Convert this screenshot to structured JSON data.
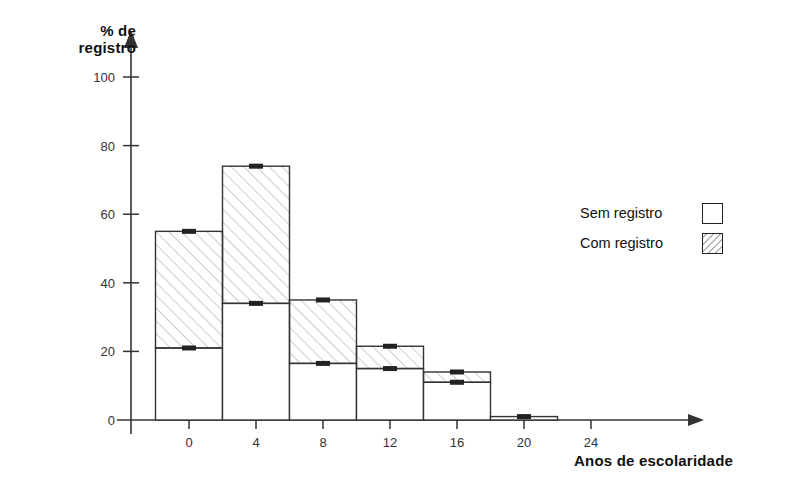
{
  "chart_data": {
    "type": "bar",
    "title": "",
    "subtitle": "",
    "xlabel": "Anos de escolaridade",
    "ylabel": "% de registro",
    "ylabel_line1": "% de",
    "ylabel_line2": "registro",
    "xlim": [
      -2,
      26
    ],
    "ylim": [
      0,
      108
    ],
    "yticks": [
      0,
      20,
      40,
      60,
      80,
      100
    ],
    "ytick_labels": [
      "0",
      "20",
      "40",
      "60",
      "80",
      "100"
    ],
    "xticks": [
      0,
      4,
      8,
      12,
      16,
      20,
      24
    ],
    "xtick_labels": [
      "0",
      "4",
      "8",
      "12",
      "16",
      "20",
      "24"
    ],
    "grid": false,
    "legend_position": "right",
    "stacked": true,
    "bin_width": 4,
    "bin_starts": [
      -2,
      2,
      6,
      10,
      14,
      18
    ],
    "bin_centers": [
      0,
      4,
      8,
      12,
      16,
      20
    ],
    "series": [
      {
        "name": "Com registro",
        "fill": "hatched",
        "values": [
          34,
          40,
          18.5,
          6.5,
          3,
          0
        ]
      },
      {
        "name": "Sem registro",
        "fill": "white",
        "values": [
          21,
          34,
          16.5,
          15,
          11,
          1
        ]
      }
    ],
    "totals": [
      55,
      74,
      35,
      21.5,
      14,
      1
    ],
    "lower_segment_tops": [
      21,
      34,
      16.5,
      15,
      11,
      1
    ]
  },
  "legend": {
    "items": [
      {
        "label": "Sem registro",
        "swatch": "white"
      },
      {
        "label": "Com registro",
        "swatch": "hatched"
      }
    ]
  },
  "axes": {
    "y_title_line1": "% de",
    "y_title_line2": "registro",
    "x_title": "Anos de escolaridade"
  },
  "colors": {
    "axis": "#333333",
    "bar_outline": "#333333",
    "bar_fill": "#ffffff",
    "hatch": "#8a8a8a",
    "text": "#111111"
  }
}
